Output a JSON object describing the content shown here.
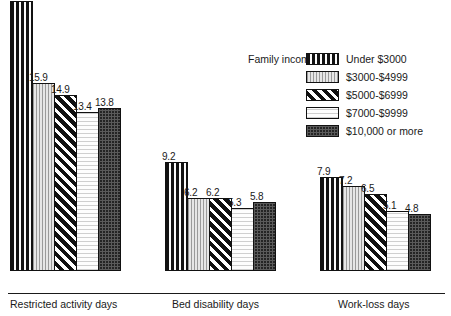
{
  "chart_data": {
    "type": "bar",
    "title": "",
    "subtitle": "",
    "xlabel": "",
    "ylabel": "",
    "grid": false,
    "axis_visible": {
      "x": true,
      "y": false
    },
    "ylim": [
      0,
      22.8
    ],
    "value_labels_shown": true,
    "legend": {
      "position": "top-right",
      "title": "Family income",
      "entries": [
        {
          "label": "Under $3000",
          "pattern": "vertical-bold-stripes"
        },
        {
          "label": "$3000-$4999",
          "pattern": "vertical-light-stripes"
        },
        {
          "label": "$5000-$6999",
          "pattern": "diagonal-stripes"
        },
        {
          "label": "$7000-$9999",
          "pattern": "white-horizontal-lines"
        },
        {
          "label": "$10,000 or more",
          "pattern": "dark-stipple"
        }
      ]
    },
    "categories": [
      "Restricted activity days",
      "Bed disability days",
      "Work-loss days"
    ],
    "series": [
      {
        "name": "Under $3000",
        "values": [
          22.8,
          9.2,
          7.9
        ]
      },
      {
        "name": "$3000-$4999",
        "values": [
          15.9,
          6.2,
          7.2
        ]
      },
      {
        "name": "$5000-$6999",
        "values": [
          14.9,
          6.2,
          6.5
        ]
      },
      {
        "name": "$7000-$9999",
        "values": [
          13.4,
          5.3,
          5.1
        ]
      },
      {
        "name": "$10,000 or more",
        "values": [
          13.8,
          5.8,
          4.8
        ]
      }
    ],
    "groups": [
      {
        "category": "Restricted activity days",
        "left": 10,
        "label_left": 10,
        "bars": [
          {
            "value": 22.8,
            "label": "22.8",
            "pattern": "vertical-bold-stripes"
          },
          {
            "value": 15.9,
            "label": "15.9",
            "pattern": "vertical-light-stripes"
          },
          {
            "value": 14.9,
            "label": "14.9",
            "pattern": "diagonal-stripes"
          },
          {
            "value": 13.4,
            "label": "13.4",
            "pattern": "white-horizontal-lines"
          },
          {
            "value": 13.8,
            "label": "13.8",
            "pattern": "dark-stipple"
          }
        ]
      },
      {
        "category": "Bed disability days",
        "left": 165,
        "label_left": 172,
        "bars": [
          {
            "value": 9.2,
            "label": "9.2",
            "pattern": "vertical-bold-stripes"
          },
          {
            "value": 6.2,
            "label": "6.2",
            "pattern": "vertical-light-stripes"
          },
          {
            "value": 6.2,
            "label": "6.2",
            "pattern": "diagonal-stripes"
          },
          {
            "value": 5.3,
            "label": "5.3",
            "pattern": "white-horizontal-lines"
          },
          {
            "value": 5.8,
            "label": "5.8",
            "pattern": "dark-stipple"
          }
        ]
      },
      {
        "category": "Work-loss days",
        "left": 320,
        "label_left": 338,
        "bars": [
          {
            "value": 7.9,
            "label": "7.9",
            "pattern": "vertical-bold-stripes"
          },
          {
            "value": 7.2,
            "label": "7.2",
            "pattern": "vertical-light-stripes"
          },
          {
            "value": 6.5,
            "label": "6.5",
            "pattern": "diagonal-stripes"
          },
          {
            "value": 5.1,
            "label": "5.1",
            "pattern": "white-horizontal-lines"
          },
          {
            "value": 4.8,
            "label": "4.8",
            "pattern": "dark-stipple"
          }
        ]
      }
    ]
  }
}
